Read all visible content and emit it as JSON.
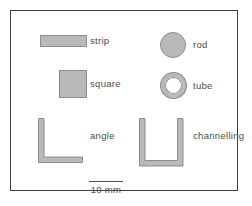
{
  "figure": {
    "items": [
      {
        "label": "strip",
        "shape": "rectangle"
      },
      {
        "label": "rod",
        "shape": "filled-circle"
      },
      {
        "label": "square",
        "shape": "filled-square"
      },
      {
        "label": "tube",
        "shape": "ring"
      },
      {
        "label": "angle",
        "shape": "L-profile"
      },
      {
        "label": "channelling",
        "shape": "U-profile"
      }
    ],
    "scale_bar": {
      "label": "10 mm"
    },
    "colors": {
      "shape_fill": "#b9b9b9",
      "shape_border": "#8c8c8c",
      "frame_border": "#3f3f3f",
      "text": "#4d4d4d",
      "background": "#ffffff"
    }
  }
}
